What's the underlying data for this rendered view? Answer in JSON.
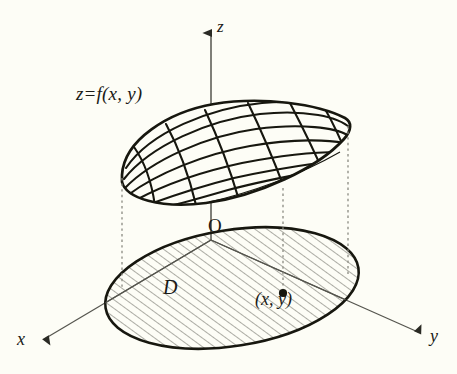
{
  "figure": {
    "background_color": "#fdfdf6",
    "ink_color": "#1a1a16",
    "axis_color": "#55554e",
    "dash_color": "#8a8a80",
    "labels": {
      "surface_equation": "z=f(x, y)",
      "axis_z": "z",
      "axis_x": "x",
      "axis_y": "y",
      "origin": "O",
      "domain": "D",
      "point": "(x, y)"
    },
    "axes": [
      {
        "name": "z",
        "label": "z",
        "direction": "up",
        "arrow": "solid-triangle"
      },
      {
        "name": "x",
        "label": "x",
        "direction": "down-left",
        "arrow": "solid-triangle"
      },
      {
        "name": "y",
        "label": "y",
        "direction": "down-right",
        "arrow": "solid-triangle"
      }
    ],
    "surface": {
      "name": "z=f(x, y)",
      "shape": "tilted dome / ellipsoid cap",
      "mesh": "curvilinear grid",
      "mesh_u_lines": 7,
      "mesh_v_lines": 5
    },
    "domain": {
      "name": "D",
      "shape": "ellipse",
      "fill": "diagonal hatching",
      "hatch_angle_deg": 45,
      "outline": "thick solid"
    },
    "marked_point": {
      "label": "(x, y)",
      "marker": "filled dot"
    },
    "projection_lines": {
      "style": "dotted vertical",
      "count": 3
    }
  }
}
